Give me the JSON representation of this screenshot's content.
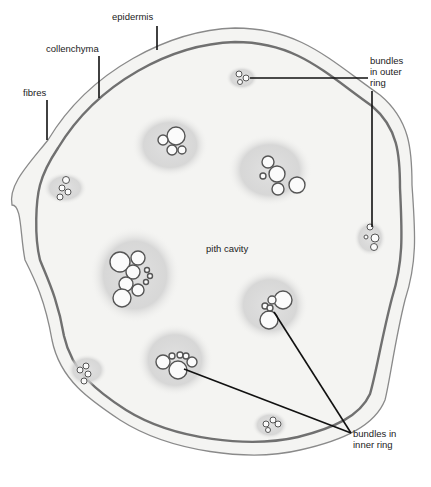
{
  "figure": {
    "labels": {
      "epidermis": "epidermis",
      "collenchyma": "collenchyma",
      "fibres": "fibres",
      "bundles_outer": "bundles\nin outer\nring",
      "pith_cavity": "pith cavity",
      "bundles_inner": "bundles in\ninner ring"
    },
    "colors": {
      "background": "#ffffff",
      "tissue": "#f3f3f1",
      "epidermis_line": "#6a6a6a",
      "fibre_ring": "#7a7a7a",
      "bundle_shade": "#cfcfcf",
      "leader_line": "#111111"
    }
  }
}
